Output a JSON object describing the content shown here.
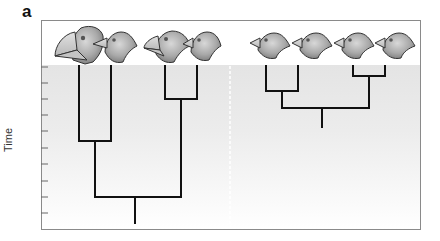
{
  "figure": {
    "panel_label": "a",
    "y_axis_label": "Time",
    "colors": {
      "branch": "#111111",
      "frame": "#8a8a8a",
      "plot_bg_top": "#e4e4e4",
      "plot_bg_bottom": "#ffffff",
      "divider": "#ffffff"
    },
    "tick_count": 10,
    "birds": [
      {
        "group": "left",
        "description": "large-beaked finch head",
        "x": 79
      },
      {
        "group": "left",
        "description": "pointed-beaked finch head",
        "x": 111
      },
      {
        "group": "left",
        "description": "medium-beaked finch head",
        "x": 165
      },
      {
        "group": "left",
        "description": "small-beaked finch head",
        "x": 197
      },
      {
        "group": "right",
        "description": "finch head",
        "x": 266
      },
      {
        "group": "right",
        "description": "finch head",
        "x": 298
      },
      {
        "group": "right",
        "description": "finch head",
        "x": 353
      },
      {
        "group": "right",
        "description": "finch head",
        "x": 385
      }
    ],
    "trees": [
      {
        "name": "left-phylogeny",
        "leaves_x": [
          79,
          111,
          165,
          197
        ],
        "inner_join_y": [
          141,
          99
        ],
        "root_join_y": 197,
        "root_x": 135,
        "root_bottom_y": 223
      },
      {
        "name": "right-phylogeny",
        "leaves_x": [
          266,
          298,
          353,
          385
        ],
        "inner_join_y": [
          91,
          76
        ],
        "root_join_y": 108,
        "root_x": 322,
        "root_bottom_y": 127
      }
    ]
  }
}
